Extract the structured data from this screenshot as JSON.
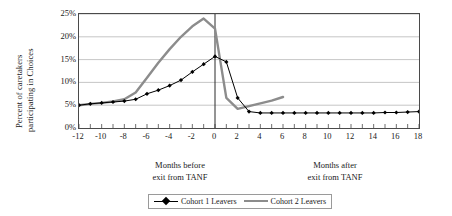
{
  "chart_data": {
    "type": "line",
    "title": "",
    "xlabel_before": "Months before exit from TANF",
    "xlabel_after": "Months after exit from TANF",
    "ylabel": "Percent of caretakers participating in Choices",
    "xlim": [
      -12,
      18
    ],
    "ylim": [
      0,
      25
    ],
    "yticks": [
      0,
      5,
      10,
      15,
      20,
      25
    ],
    "ytick_labels": [
      "0%",
      "5%",
      "10%",
      "15%",
      "20%",
      "25%"
    ],
    "xticks": [
      -12,
      -11,
      -10,
      -9,
      -8,
      -7,
      -6,
      -5,
      -4,
      -3,
      -2,
      -1,
      0,
      1,
      2,
      3,
      4,
      5,
      6,
      7,
      8,
      9,
      10,
      11,
      12,
      13,
      14,
      15,
      16,
      17,
      18
    ],
    "xtick_labels_shown": [
      -12,
      -10,
      -8,
      -6,
      -4,
      -2,
      0,
      2,
      4,
      6,
      8,
      10,
      12,
      14,
      16,
      18
    ],
    "grid": "horizontal",
    "legend_position": "bottom-center",
    "reference_line_x": 0,
    "series": [
      {
        "name": "Cohort 1 Leavers",
        "color": "#000000",
        "marker": "diamond",
        "line_width": 1,
        "x": [
          -12,
          -11,
          -10,
          -9,
          -8,
          -7,
          -6,
          -5,
          -4,
          -3,
          -2,
          -1,
          0,
          1,
          2,
          3,
          4,
          5,
          6,
          7,
          8,
          9,
          10,
          11,
          12,
          13,
          14,
          15,
          16,
          17,
          18
        ],
        "values": [
          5.0,
          5.3,
          5.5,
          5.7,
          5.9,
          6.3,
          7.5,
          8.3,
          9.3,
          10.5,
          12.3,
          14.0,
          15.7,
          14.5,
          6.6,
          3.6,
          3.3,
          3.3,
          3.3,
          3.3,
          3.3,
          3.3,
          3.3,
          3.3,
          3.3,
          3.3,
          3.3,
          3.4,
          3.4,
          3.5,
          3.6
        ]
      },
      {
        "name": "Cohort 2 Leavers",
        "color": "#8c8c8c",
        "marker": "none",
        "line_width": 2.4,
        "x": [
          -12,
          -11,
          -10,
          -9,
          -8,
          -7,
          -6,
          -5,
          -4,
          -3,
          -2,
          -1,
          0,
          1,
          2,
          3,
          4,
          5,
          6
        ],
        "values": [
          5.0,
          5.3,
          5.5,
          5.8,
          6.3,
          7.8,
          11.0,
          14.3,
          17.3,
          20.0,
          22.3,
          24.0,
          21.8,
          6.6,
          4.2,
          4.8,
          5.4,
          6.0,
          6.8
        ]
      }
    ]
  },
  "axes": {
    "y_title_line1": "Percent of caretakers",
    "y_title_line2": "participating in Choices",
    "x_caption_before_line1": "Months before",
    "x_caption_before_line2": "exit from TANF",
    "x_caption_after_line1": "Months after",
    "x_caption_after_line2": "exit from TANF"
  },
  "legend": {
    "items": [
      {
        "label": "Cohort 1 Leavers"
      },
      {
        "label": "Cohort 2 Leavers"
      }
    ]
  },
  "colors": {
    "cohort1": "#000000",
    "cohort2": "#8c8c8c",
    "axis": "#4a4a4a",
    "grid": "#b8b8b8",
    "text": "#1a1a1a"
  }
}
